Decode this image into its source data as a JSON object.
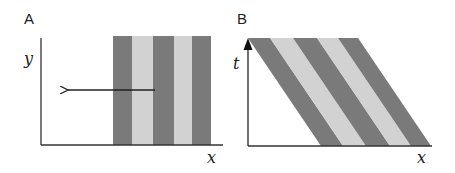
{
  "panels": [
    {
      "label": "A",
      "x_axis_label": "x",
      "y_axis_label": "y",
      "description": "Vertical grating of alternating dark and light stripes moving leftward (arrow)",
      "stripes": [
        "dark",
        "light",
        "dark",
        "light",
        "dark"
      ],
      "arrow_direction": "left"
    },
    {
      "label": "B",
      "x_axis_label": "x",
      "y_axis_label": "t",
      "description": "Space-time plot: stripes appear as diagonal bands sloping down-right"
    }
  ],
  "colors": {
    "dark_stripe": "#7a7a7a",
    "light_stripe": "#d2d2d2",
    "axis": "#333333",
    "background": "#ffffff"
  }
}
